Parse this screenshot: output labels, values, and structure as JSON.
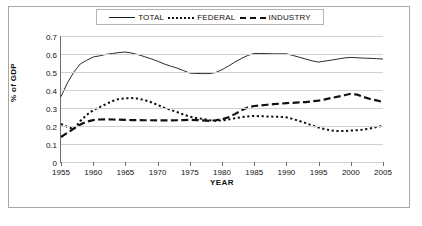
{
  "chart_data": {
    "type": "line",
    "title": "",
    "xlabel": "YEAR",
    "ylabel": "% of GDP",
    "xlim": [
      1955,
      2005
    ],
    "ylim": [
      0,
      0.7
    ],
    "grid": true,
    "legend_position": "top",
    "ytick_labels": [
      "0.7",
      "0.6",
      "0.5",
      "0.4",
      "0.3",
      "0.2",
      "0.1",
      "0"
    ],
    "ytick_values": [
      0.7,
      0.6,
      0.5,
      0.4,
      0.3,
      0.2,
      0.1,
      0
    ],
    "xtick_labels": [
      "1955",
      "1960",
      "1965",
      "1970",
      "1975",
      "1980",
      "1985",
      "1990",
      "1995",
      "2000",
      "2005"
    ],
    "xtick_values": [
      1955,
      1960,
      1965,
      1970,
      1975,
      1980,
      1985,
      1990,
      1995,
      2000,
      2005
    ],
    "x": [
      1955,
      1956,
      1957,
      1958,
      1959,
      1960,
      1961,
      1962,
      1963,
      1964,
      1965,
      1966,
      1967,
      1968,
      1969,
      1970,
      1971,
      1972,
      1973,
      1974,
      1975,
      1976,
      1977,
      1978,
      1979,
      1980,
      1981,
      1982,
      1983,
      1984,
      1985,
      1986,
      1987,
      1988,
      1989,
      1990,
      1991,
      1992,
      1993,
      1994,
      1995,
      1996,
      1997,
      1998,
      1999,
      2000,
      2001,
      2002,
      2003,
      2004,
      2005
    ],
    "series": [
      {
        "name": "TOTAL",
        "style": "solid",
        "color": "#2b2b2b",
        "values": [
          0.363,
          0.44,
          0.5,
          0.545,
          0.565,
          0.583,
          0.59,
          0.598,
          0.603,
          0.608,
          0.611,
          0.605,
          0.596,
          0.585,
          0.573,
          0.56,
          0.545,
          0.533,
          0.522,
          0.508,
          0.494,
          0.492,
          0.491,
          0.491,
          0.497,
          0.513,
          0.533,
          0.555,
          0.575,
          0.592,
          0.603,
          0.603,
          0.602,
          0.601,
          0.601,
          0.601,
          0.592,
          0.582,
          0.572,
          0.562,
          0.555,
          0.561,
          0.566,
          0.572,
          0.578,
          0.581,
          0.579,
          0.577,
          0.576,
          0.574,
          0.572
        ]
      },
      {
        "name": "FEDERAL",
        "style": "dotted",
        "color": "#111111",
        "values": [
          0.212,
          0.195,
          0.182,
          0.228,
          0.262,
          0.288,
          0.305,
          0.322,
          0.339,
          0.35,
          0.354,
          0.355,
          0.352,
          0.344,
          0.332,
          0.317,
          0.302,
          0.29,
          0.278,
          0.264,
          0.252,
          0.245,
          0.24,
          0.232,
          0.229,
          0.231,
          0.236,
          0.243,
          0.249,
          0.253,
          0.256,
          0.254,
          0.253,
          0.252,
          0.251,
          0.248,
          0.239,
          0.228,
          0.216,
          0.203,
          0.191,
          0.182,
          0.175,
          0.172,
          0.172,
          0.175,
          0.177,
          0.18,
          0.186,
          0.194,
          0.201
        ]
      },
      {
        "name": "INDUSTRY",
        "style": "dashed",
        "color": "#111111",
        "values": [
          0.139,
          0.162,
          0.186,
          0.208,
          0.224,
          0.233,
          0.236,
          0.237,
          0.236,
          0.235,
          0.234,
          0.233,
          0.233,
          0.232,
          0.232,
          0.231,
          0.231,
          0.231,
          0.232,
          0.233,
          0.234,
          0.233,
          0.231,
          0.229,
          0.232,
          0.237,
          0.249,
          0.266,
          0.287,
          0.303,
          0.311,
          0.314,
          0.318,
          0.321,
          0.324,
          0.327,
          0.329,
          0.331,
          0.333,
          0.337,
          0.341,
          0.348,
          0.356,
          0.363,
          0.371,
          0.379,
          0.374,
          0.361,
          0.35,
          0.342,
          0.333
        ]
      }
    ]
  },
  "legend": {
    "entries": [
      {
        "label": "TOTAL",
        "style": "solid"
      },
      {
        "label": "FEDERAL",
        "style": "dotted"
      },
      {
        "label": "INDUSTRY",
        "style": "dashed"
      }
    ]
  },
  "axes": {
    "y_title": "% of GDP",
    "x_title": "YEAR"
  }
}
